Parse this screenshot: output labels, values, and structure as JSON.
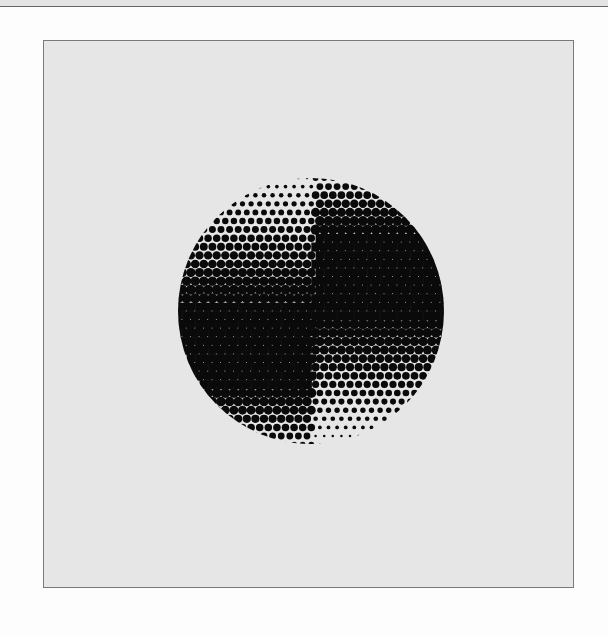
{
  "image": {
    "description": "Halftone dot circle divided into four quadrants with offset dark bands",
    "colors": {
      "page_background": "#fdfdfd",
      "panel_background": "#e6e6e6",
      "panel_border": "#7a7a7a",
      "ink": "#0a0a0a",
      "paper_dot": "#e6e6e6"
    },
    "halftone": {
      "quadrants": [
        {
          "name": "top-left",
          "gradient": "light at top to dark at bottom"
        },
        {
          "name": "top-right",
          "gradient": "medium at top, solid dark band through middle"
        },
        {
          "name": "bottom-left",
          "gradient": "solid dark band at top, light at bottom"
        },
        {
          "name": "bottom-right",
          "gradient": "dark at top to light at bottom"
        }
      ]
    }
  }
}
